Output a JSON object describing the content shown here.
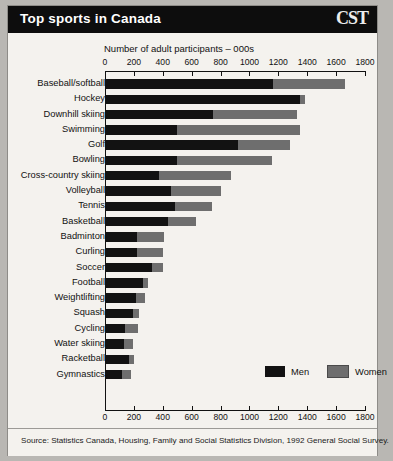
{
  "header": {
    "title": "Top sports in Canada",
    "logo": "CST"
  },
  "source": {
    "text": "Source: Statistics Canada, Housing, Family and Social Statistics Division, 1992 General Social Survey."
  },
  "legend": {
    "men_label": "Men",
    "women_label": "Women",
    "men_color": "#121212",
    "women_color": "#6e6e6e"
  },
  "chart_data": {
    "type": "bar",
    "orientation": "horizontal",
    "stacked": true,
    "title": "Top sports in Canada",
    "xlabel": "Number of adult participants – 000s",
    "ylabel": "",
    "xlim": [
      0,
      1800
    ],
    "xticks": [
      0,
      200,
      400,
      600,
      800,
      1000,
      1200,
      1400,
      1600,
      1800
    ],
    "grid": false,
    "legend_position": "inside-right",
    "categories": [
      "Baseball/softball",
      "Hockey",
      "Downhill skiing",
      "Swimming",
      "Golf",
      "Bowling",
      "Cross-country skiing",
      "Volleyball",
      "Tennis",
      "Basketball",
      "Badminton",
      "Curling",
      "Soccer",
      "Football",
      "Weightlifting",
      "Squash",
      "Cycling",
      "Water skiing",
      "Racketball",
      "Gymnastics"
    ],
    "series": [
      {
        "name": "Men",
        "color": "#121212",
        "values": [
          1165,
          1350,
          745,
          500,
          920,
          500,
          375,
          455,
          485,
          435,
          220,
          220,
          325,
          260,
          215,
          195,
          140,
          130,
          165,
          115
        ]
      },
      {
        "name": "Women",
        "color": "#6e6e6e",
        "values": [
          500,
          35,
          585,
          850,
          360,
          655,
          500,
          350,
          255,
          195,
          190,
          180,
          75,
          40,
          60,
          40,
          90,
          65,
          35,
          65
        ]
      }
    ],
    "totals": [
      1665,
      1385,
      1330,
      1350,
      1280,
      1155,
      875,
      805,
      740,
      630,
      410,
      400,
      400,
      300,
      275,
      235,
      230,
      195,
      200,
      180
    ]
  }
}
